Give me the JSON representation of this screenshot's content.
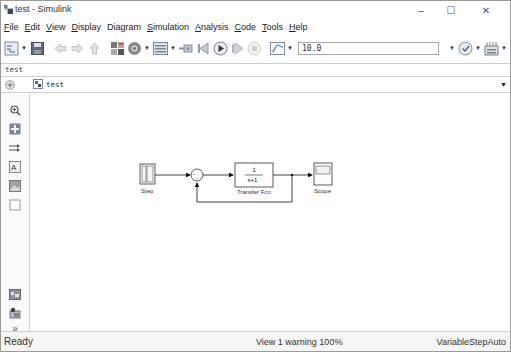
{
  "window": {
    "title": "test - Simulink",
    "controls": {
      "minimize": "–",
      "maximize": "☐",
      "close": "✕"
    }
  },
  "menubar": {
    "items": [
      {
        "label": "File",
        "mnemonic": "F"
      },
      {
        "label": "Edit",
        "mnemonic": "E"
      },
      {
        "label": "View",
        "mnemonic": "V"
      },
      {
        "label": "Display",
        "mnemonic": "D"
      },
      {
        "label": "Diagram",
        "mnemonic": "g"
      },
      {
        "label": "Simulation",
        "mnemonic": "S"
      },
      {
        "label": "Analysis",
        "mnemonic": "A"
      },
      {
        "label": "Code",
        "mnemonic": "C"
      },
      {
        "label": "Tools",
        "mnemonic": "T"
      },
      {
        "label": "Help",
        "mnemonic": "H"
      }
    ]
  },
  "toolbar": {
    "icons": [
      "new-model-icon",
      "save-icon",
      "back-icon",
      "forward-icon",
      "up-icon",
      "library-browser-icon",
      "model-config-icon",
      "model-explorer-icon",
      "connect-icon",
      "step-back-icon",
      "run-icon",
      "step-forward-icon",
      "stop-icon",
      "data-inspector-icon",
      "model-advisor-icon",
      "build-icon"
    ],
    "stop_time": "10.0"
  },
  "explorer_bar": {
    "tab_label": "test",
    "address": "test"
  },
  "palette": {
    "icons": [
      "zoom-icon",
      "fit-to-view-icon",
      "signal-lines-icon",
      "annotation-icon",
      "image-icon",
      "area-icon",
      "model-browser-icon",
      "report-icon",
      "expand-icon"
    ]
  },
  "diagram": {
    "blocks": [
      {
        "name": "Step",
        "type": "step"
      },
      {
        "name": "Sum",
        "type": "sum",
        "signs": "+-"
      },
      {
        "name": "Transfer Fcn",
        "type": "transfer_fcn",
        "numerator": "1",
        "denominator": "s+1"
      },
      {
        "name": "Scope",
        "type": "scope"
      }
    ]
  },
  "statusbar": {
    "state": "Ready",
    "view_info": "View 1 warning  100%",
    "solver": "VariableStepAuto"
  }
}
